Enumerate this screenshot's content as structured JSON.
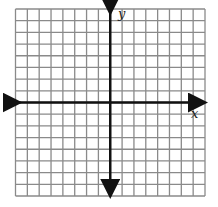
{
  "diagram": {
    "type": "coordinate-grid",
    "columns": 16,
    "rows": 16,
    "grid": {
      "left": 15.5,
      "top": 9,
      "right": 205,
      "bottom": 196
    },
    "origin": {
      "x": 110,
      "y": 103
    },
    "colors": {
      "grid": "#8a8a8a",
      "axis": "#111111",
      "background": "#ffffff"
    },
    "axes": {
      "x": {
        "label": "x",
        "arrows": "both"
      },
      "y": {
        "label": "y",
        "arrows": "both"
      }
    }
  }
}
